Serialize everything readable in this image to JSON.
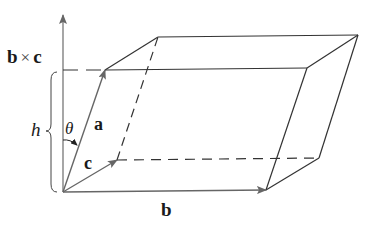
{
  "figure": {
    "type": "parallelepiped-volume-diagram",
    "labels": {
      "cross_product_b": "b",
      "cross_product_times": "×",
      "cross_product_c": "c",
      "height": "h",
      "angle": "θ",
      "vector_a": "a",
      "vector_b": "b",
      "vector_c": "c"
    },
    "vertices": {
      "origin": [
        63,
        192
      ],
      "a": [
        105,
        70
      ],
      "b": [
        266,
        190
      ],
      "c": [
        117,
        160
      ],
      "a_plus_b": [
        307,
        68
      ],
      "a_plus_c": [
        158,
        37
      ],
      "b_plus_c": [
        319,
        158
      ],
      "a_plus_b_plus_c": [
        358,
        35
      ]
    },
    "colors": {
      "line": "#3a3a3a",
      "arrow": "#6a6a6a",
      "text": "#1a1a1a"
    }
  }
}
